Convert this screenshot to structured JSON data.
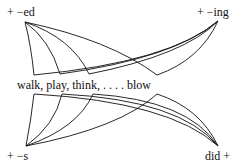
{
  "labels": {
    "top_left": "+  −ed",
    "top_right": "+  −ing",
    "middle": "walk, play, think, . . . . blow",
    "bottom_left": "+  −s",
    "bottom_right": "did  +"
  },
  "nodes": {
    "ed": {
      "x": 25,
      "y": 22
    },
    "ing": {
      "x": 218,
      "y": 21
    },
    "s": {
      "x": 26,
      "y": 146
    },
    "did": {
      "x": 218,
      "y": 146
    }
  },
  "words": [
    "walk",
    "play",
    "think",
    "blow"
  ],
  "colors": {
    "line": "#111111",
    "background": "#ffffff"
  }
}
